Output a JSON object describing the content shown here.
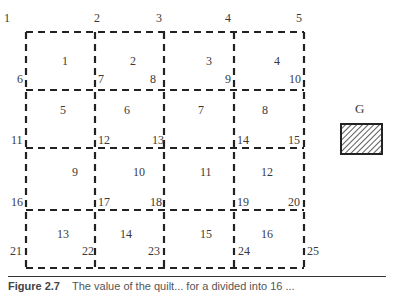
{
  "figure": {
    "grid": {
      "rows": 4,
      "cols": 4,
      "x_lines": [
        26,
        95,
        164,
        234,
        304
      ],
      "y_lines": [
        32,
        90,
        148,
        210,
        268
      ],
      "line_style": "dashed",
      "line_color": "#222222"
    },
    "node_labels": [
      {
        "id": "1",
        "text": "1",
        "x": 4,
        "y": 12
      },
      {
        "id": "2",
        "text": "2",
        "x": 94,
        "y": 12
      },
      {
        "id": "3",
        "text": "3",
        "x": 156,
        "y": 12
      },
      {
        "id": "4",
        "text": "4",
        "x": 225,
        "y": 12
      },
      {
        "id": "5",
        "text": "5",
        "x": 296,
        "y": 12
      },
      {
        "id": "6",
        "text": "6",
        "x": 17,
        "y": 73
      },
      {
        "id": "7",
        "text": "7",
        "x": 98,
        "y": 73
      },
      {
        "id": "8",
        "text": "8",
        "x": 150,
        "y": 73
      },
      {
        "id": "9",
        "text": "9",
        "x": 225,
        "y": 73
      },
      {
        "id": "10",
        "text": "10",
        "x": 289,
        "y": 73
      },
      {
        "id": "11",
        "text": "11",
        "x": 11,
        "y": 134
      },
      {
        "id": "12",
        "text": "12",
        "x": 98,
        "y": 134
      },
      {
        "id": "13",
        "text": "13",
        "x": 152,
        "y": 134
      },
      {
        "id": "14",
        "text": "14",
        "x": 237,
        "y": 134
      },
      {
        "id": "15",
        "text": "15",
        "x": 288,
        "y": 134
      },
      {
        "id": "16",
        "text": "16",
        "x": 11,
        "y": 196
      },
      {
        "id": "17",
        "text": "17",
        "x": 98,
        "y": 196
      },
      {
        "id": "18",
        "text": "18",
        "x": 150,
        "y": 196
      },
      {
        "id": "19",
        "text": "19",
        "x": 237,
        "y": 196
      },
      {
        "id": "20",
        "text": "20",
        "x": 288,
        "y": 196
      },
      {
        "id": "21",
        "text": "21",
        "x": 10,
        "y": 245
      },
      {
        "id": "22",
        "text": "22",
        "x": 82,
        "y": 245
      },
      {
        "id": "23",
        "text": "23",
        "x": 148,
        "y": 245
      },
      {
        "id": "24",
        "text": "24",
        "x": 238,
        "y": 245
      },
      {
        "id": "25",
        "text": "25",
        "x": 307,
        "y": 245
      }
    ],
    "cell_labels": [
      {
        "id": "c1",
        "text": "1",
        "x": 62,
        "y": 55
      },
      {
        "id": "c2",
        "text": "2",
        "x": 130,
        "y": 55
      },
      {
        "id": "c3",
        "text": "3",
        "x": 206,
        "y": 55
      },
      {
        "id": "c4",
        "text": "4",
        "x": 274,
        "y": 55
      },
      {
        "id": "c5",
        "text": "5",
        "x": 60,
        "y": 104
      },
      {
        "id": "c6",
        "text": "6",
        "x": 124,
        "y": 104
      },
      {
        "id": "c7",
        "text": "7",
        "x": 198,
        "y": 104
      },
      {
        "id": "c8",
        "text": "8",
        "x": 262,
        "y": 104
      },
      {
        "id": "c9",
        "text": "9",
        "x": 72,
        "y": 166
      },
      {
        "id": "c10",
        "text": "10",
        "x": 133,
        "y": 166
      },
      {
        "id": "c11",
        "text": "11",
        "x": 200,
        "y": 166
      },
      {
        "id": "c12",
        "text": "12",
        "x": 261,
        "y": 166
      },
      {
        "id": "c13",
        "text": "13",
        "x": 57,
        "y": 228
      },
      {
        "id": "c14",
        "text": "14",
        "x": 120,
        "y": 228
      },
      {
        "id": "c15",
        "text": "15",
        "x": 200,
        "y": 228
      },
      {
        "id": "c16",
        "text": "16",
        "x": 261,
        "y": 228
      }
    ],
    "legend": {
      "label": "G",
      "swatch": {
        "x": 341,
        "y": 124,
        "width": 41,
        "height": 30,
        "pattern": "diagonal-hatch"
      }
    },
    "caption": {
      "prefix": "Figure 2.7",
      "text": "The value of the quilt... for a divided into 16 ..."
    }
  }
}
